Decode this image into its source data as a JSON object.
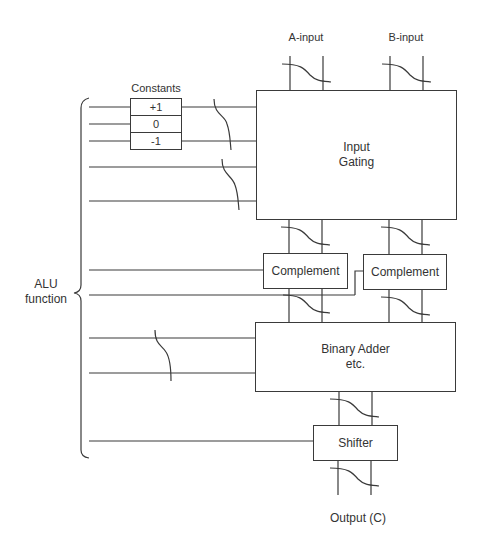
{
  "diagram": {
    "type": "ALU block diagram",
    "inputs": {
      "a_label": "A-input",
      "b_label": "B-input"
    },
    "constants": {
      "title": "Constants",
      "values": [
        "+1",
        "0",
        "-1"
      ]
    },
    "blocks": {
      "input_gating": {
        "line1": "Input",
        "line2": "Gating"
      },
      "complement_a": "Complement",
      "complement_b": "Complement",
      "adder": {
        "line1": "Binary Adder",
        "line2": "etc."
      },
      "shifter": "Shifter"
    },
    "control": {
      "line1": "ALU",
      "line2": "function"
    },
    "output": "Output (C)",
    "colors": {
      "stroke": "#3a3a3a",
      "text": "#333333",
      "background": "#ffffff"
    }
  }
}
